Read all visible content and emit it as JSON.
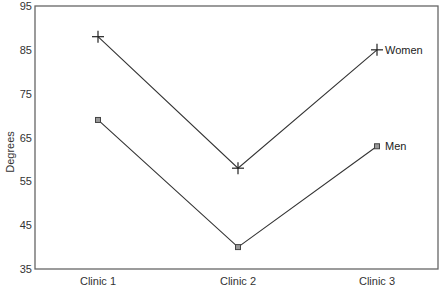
{
  "chart_data": {
    "type": "line",
    "title": "",
    "xlabel": "",
    "ylabel": "Degrees",
    "categories": [
      "Clinic 1",
      "Clinic 2",
      "Clinic 3"
    ],
    "series": [
      {
        "name": "Women",
        "marker": "plus",
        "values": [
          88,
          58,
          85
        ]
      },
      {
        "name": "Men",
        "marker": "square",
        "values": [
          69,
          40,
          63
        ]
      }
    ],
    "ylim": [
      35,
      95
    ],
    "yticks": [
      35,
      45,
      55,
      65,
      75,
      85,
      95
    ],
    "grid": false,
    "legend": "direct labels at end of lines"
  },
  "labels": {
    "ylabel": "Degrees",
    "women": "Women",
    "men": "Men"
  },
  "colors": {
    "line": "#333333",
    "frame": "#666666",
    "marker_fill": "#999999"
  }
}
